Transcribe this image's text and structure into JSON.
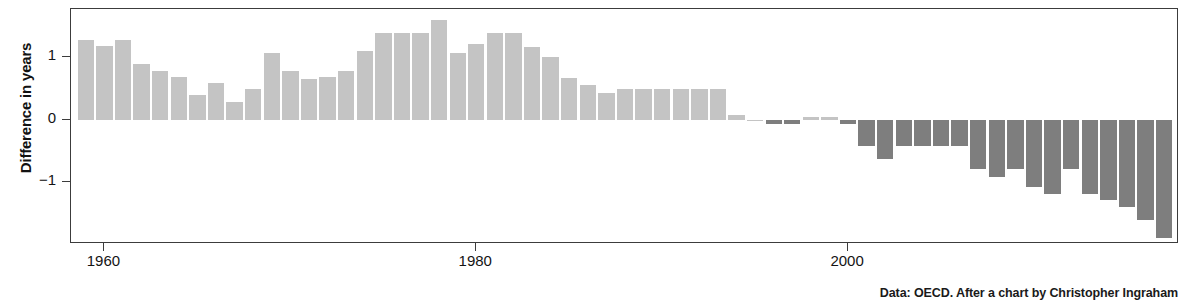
{
  "chart_data": {
    "type": "bar",
    "title": "",
    "subtitle": "",
    "xlabel": "",
    "ylabel": "Difference in years",
    "xlim": [
      1958.2,
      2017.8
    ],
    "ylim": [
      -2.0,
      1.78
    ],
    "grid": false,
    "legend": null,
    "zero_line": 0,
    "ytick_labels": [
      "1",
      "0",
      "−1"
    ],
    "ytick_values": [
      1,
      0,
      -1
    ],
    "xtick_labels": [
      "1960",
      "1980",
      "2000"
    ],
    "xtick_values": [
      1960,
      1980,
      2000
    ],
    "colors": {
      "positive_bar": "#c4c4c4",
      "negative_bar": "#7e7e7e",
      "axis": "#3c3c3c",
      "text": "#141414",
      "background": "#ffffff"
    },
    "x": [
      1959,
      1960,
      1961,
      1962,
      1963,
      1964,
      1965,
      1966,
      1967,
      1968,
      1969,
      1970,
      1971,
      1972,
      1973,
      1974,
      1975,
      1976,
      1977,
      1978,
      1979,
      1980,
      1981,
      1982,
      1983,
      1984,
      1985,
      1986,
      1987,
      1988,
      1989,
      1990,
      1991,
      1992,
      1993,
      1994,
      1995,
      1996,
      1997,
      1998,
      1999,
      2000,
      2001,
      2002,
      2003,
      2004,
      2005,
      2006,
      2007,
      2008,
      2009,
      2010,
      2011,
      2012,
      2013,
      2014,
      2015,
      2016,
      2017
    ],
    "values": [
      1.28,
      1.19,
      1.28,
      0.89,
      0.79,
      0.69,
      0.4,
      0.59,
      0.29,
      0.5,
      1.08,
      0.79,
      0.66,
      0.69,
      0.79,
      1.1,
      1.39,
      1.39,
      1.39,
      1.61,
      1.08,
      1.21,
      1.39,
      1.39,
      1.17,
      1.0,
      0.67,
      0.55,
      0.43,
      0.49,
      0.5,
      0.5,
      0.5,
      0.5,
      0.5,
      0.08,
      0.0,
      -0.07,
      -0.07,
      0.04,
      0.04,
      -0.07,
      -0.43,
      -0.64,
      -0.43,
      -0.43,
      -0.43,
      -0.43,
      -0.8,
      -0.93,
      -0.8,
      -1.08,
      -1.19,
      -0.8,
      -1.19,
      -1.3,
      -1.4,
      -1.62,
      -1.9
    ],
    "series_name": "Difference in years",
    "caption": "Data: OECD. After a chart by Christopher Ingraham"
  }
}
